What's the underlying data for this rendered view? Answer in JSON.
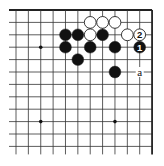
{
  "diagram": {
    "type": "go-board-fragment",
    "grid": {
      "columns": 12,
      "rows": 12,
      "origin_x": 16,
      "origin_y": 10,
      "spacing_x": 12.37,
      "spacing_y": 12.4,
      "left_overhang": 7,
      "bottom_overhang": 8,
      "edges": [
        "top",
        "right"
      ],
      "line_color": "#333333",
      "edge_color": "#222222"
    },
    "star_points": [
      {
        "col": 2,
        "row": 3
      },
      {
        "col": 2,
        "row": 9
      },
      {
        "col": 8,
        "row": 9
      }
    ],
    "stones": [
      {
        "color": "white",
        "col": 6,
        "row": 1
      },
      {
        "color": "white",
        "col": 7,
        "row": 1
      },
      {
        "color": "white",
        "col": 8,
        "row": 1
      },
      {
        "color": "black",
        "col": 4,
        "row": 2
      },
      {
        "color": "black",
        "col": 5,
        "row": 2
      },
      {
        "color": "white",
        "col": 6,
        "row": 2
      },
      {
        "color": "black",
        "col": 7,
        "row": 2
      },
      {
        "color": "white",
        "col": 9,
        "row": 2
      },
      {
        "color": "white",
        "col": 10,
        "row": 2,
        "label": "2"
      },
      {
        "color": "black",
        "col": 4,
        "row": 3
      },
      {
        "color": "black",
        "col": 6,
        "row": 3
      },
      {
        "color": "black",
        "col": 8,
        "row": 3
      },
      {
        "color": "black",
        "col": 10,
        "row": 3,
        "label": "1"
      },
      {
        "color": "black",
        "col": 5,
        "row": 4
      },
      {
        "color": "black",
        "col": 8,
        "row": 5
      }
    ],
    "point_labels": [
      {
        "col": 10,
        "row": 5,
        "text": "a"
      }
    ],
    "colors": {
      "black_stone": "#111111",
      "white_stone": "#ffffff",
      "white_stone_border": "#222222",
      "background": "#ffffff"
    }
  }
}
